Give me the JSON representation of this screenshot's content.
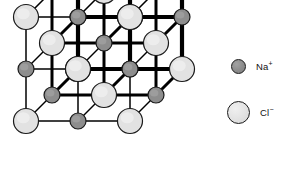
{
  "figure": {
    "background_color": "#ffffff",
    "projection": "oblique"
  },
  "legend": {
    "items": [
      {
        "id": "sodium",
        "label": "Na",
        "charge": "+",
        "icon": "sphere-icon",
        "fill_color": "#8d8d8d",
        "stroke_color": "#1a1a1a",
        "radius_px": 7.5
      },
      {
        "id": "chloride",
        "label": "Cl",
        "charge": "−",
        "icon": "sphere-icon",
        "fill_color": "#e2e2e2",
        "stroke_color": "#1a1a1a",
        "radius_px": 11.5
      }
    ]
  },
  "lattice": {
    "bond_color": "#000000",
    "bond_width_front": 4.2,
    "bond_width_mid": 3.0,
    "bond_width_back": 1.5,
    "grid_size": 3,
    "cell_spacing_x": 52,
    "cell_spacing_y": 52,
    "depth_offset_x": -26,
    "depth_offset_y": 26,
    "origin_x": 130,
    "origin_y": 17,
    "ion_order": [
      "Cl",
      "Na"
    ],
    "ion_radius": {
      "Cl": 12.5,
      "Na": 8.0
    },
    "ion_fill": {
      "Cl": "#e2e2e2",
      "Na": "#8d8d8d"
    },
    "ion_stroke": "#1a1a1a"
  }
}
